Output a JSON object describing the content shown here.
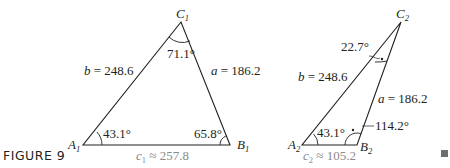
{
  "figure_label": "FIGURE 9",
  "end_marker": "■",
  "colors": {
    "line": "#231f20",
    "text": "#231f20",
    "side_c_text": "#8a8a8a"
  },
  "triangle1": {
    "vertices": {
      "A": {
        "name": "A",
        "sub": "1"
      },
      "B": {
        "name": "B",
        "sub": "1"
      },
      "C": {
        "name": "C",
        "sub": "1"
      }
    },
    "angles": {
      "A": "43.1°",
      "B": "65.8°",
      "C": "71.1°"
    },
    "sides": {
      "b": {
        "var": "b",
        "rest": " = 248.6"
      },
      "a": {
        "var": "a",
        "rest": " = 186.2"
      },
      "c": {
        "var": "c",
        "sub": "1",
        "rest": " ≈ 257.8"
      }
    }
  },
  "triangle2": {
    "vertices": {
      "A": {
        "name": "A",
        "sub": "2"
      },
      "B": {
        "name": "B",
        "sub": "2"
      },
      "C": {
        "name": "C",
        "sub": "2"
      }
    },
    "angles": {
      "A": "43.1°",
      "B": "114.2°",
      "C": "22.7°"
    },
    "sides": {
      "b": {
        "var": "b",
        "rest": " = 248.6"
      },
      "a": {
        "var": "a",
        "rest": " = 186.2"
      },
      "c": {
        "var": "c",
        "sub": "2",
        "rest": " ≈ 105.2"
      }
    }
  }
}
